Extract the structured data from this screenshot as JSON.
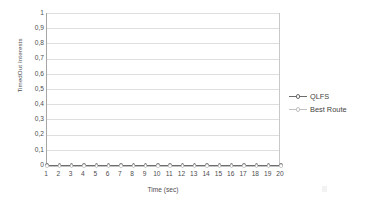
{
  "chart_data": {
    "type": "line",
    "title": "",
    "xlabel": "Time (sec)",
    "ylabel": "TimedOut Interests",
    "x": [
      1,
      2,
      3,
      4,
      5,
      6,
      7,
      8,
      9,
      10,
      11,
      12,
      13,
      14,
      15,
      16,
      17,
      18,
      19,
      20
    ],
    "xtick_labels": [
      "1",
      "2",
      "3",
      "4",
      "5",
      "6",
      "7",
      "8",
      "9",
      "10",
      "11",
      "12",
      "13",
      "14",
      "15",
      "16",
      "17",
      "18",
      "19",
      "20"
    ],
    "ytick_labels": [
      "0",
      "0,1",
      "0,2",
      "0,3",
      "0,4",
      "0,5",
      "0,6",
      "0,7",
      "0,8",
      "0,9",
      "1"
    ],
    "ytick_values": [
      0,
      0.1,
      0.2,
      0.3,
      0.4,
      0.5,
      0.6,
      0.7,
      0.8,
      0.9,
      1
    ],
    "ylim": [
      0,
      1
    ],
    "xlim": [
      1,
      20
    ],
    "grid": true,
    "legend_position": "right",
    "series": [
      {
        "name": "QLFS",
        "color": "#6d6d6d",
        "marker": "circle",
        "values": [
          0,
          0,
          0,
          0,
          0,
          0,
          0,
          0,
          0,
          0,
          0,
          0,
          0,
          0,
          0,
          0,
          0,
          0,
          0,
          0
        ]
      },
      {
        "name": "Best Route",
        "color": "#c2c2c2",
        "marker": "circle",
        "values": [
          0,
          0,
          0,
          0,
          0,
          0,
          0,
          0,
          0,
          0,
          0,
          0,
          0,
          0,
          0,
          0,
          0,
          0,
          0,
          0
        ]
      }
    ]
  },
  "legend": {
    "entries": [
      {
        "label": "QLFS"
      },
      {
        "label": "Best Route"
      }
    ]
  },
  "colors": {
    "gridline": "#dededf",
    "axis": "#a6a6a6",
    "text": "#4d4d4f",
    "series_1": "#6d6d6d",
    "series_2": "#c2c2c2",
    "background": "#ffffff"
  }
}
